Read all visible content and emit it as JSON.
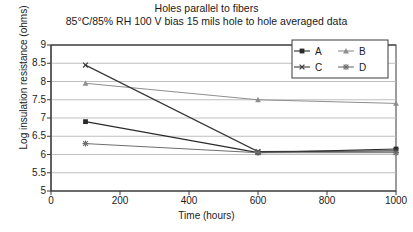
{
  "chart_data": {
    "type": "line",
    "title": "Holes parallel to fibers",
    "subtitle": "85°C/85% RH 100 V bias 15 mils hole to hole averaged data",
    "xlabel": "Time (hours)",
    "ylabel": "Log insulation resistance (ohms)",
    "xlim": [
      0,
      1000
    ],
    "ylim": [
      5,
      9
    ],
    "xticks": [
      0,
      200,
      400,
      600,
      800,
      1000
    ],
    "yticks": [
      5,
      5.5,
      6,
      6.5,
      7,
      7.5,
      8,
      8.5,
      9
    ],
    "xtick_labels": [
      "0",
      "200",
      "400",
      "600",
      "800",
      "1000"
    ],
    "ytick_labels": [
      "5",
      "5.5",
      "6",
      "6.5",
      "7",
      "7.5",
      "8",
      "8.5",
      "9"
    ],
    "grid": "horizontal",
    "legend_position": "top-right-inside",
    "x": [
      100,
      600,
      1000
    ],
    "series": [
      {
        "name": "A",
        "marker": "square",
        "values": [
          6.9,
          6.05,
          6.15
        ]
      },
      {
        "name": "B",
        "marker": "triangle",
        "values": [
          7.95,
          7.5,
          7.4
        ]
      },
      {
        "name": "C",
        "marker": "x",
        "values": [
          8.45,
          6.08,
          6.1
        ]
      },
      {
        "name": "D",
        "marker": "asterisk",
        "values": [
          6.3,
          6.05,
          6.05
        ]
      }
    ]
  },
  "legend": {
    "items": [
      {
        "label": "A",
        "marker": "square"
      },
      {
        "label": "B",
        "marker": "triangle"
      },
      {
        "label": "C",
        "marker": "x"
      },
      {
        "label": "D",
        "marker": "asterisk"
      }
    ]
  },
  "colors": {
    "axis": "#3a3a3a",
    "grid": "#b8b8b8",
    "series_a": "#2a2a2a",
    "series_b": "#8e8e8e",
    "series_c": "#3a3a3a",
    "series_d": "#6e6e6e",
    "background": "#ffffff",
    "text": "#1a1a1a"
  }
}
